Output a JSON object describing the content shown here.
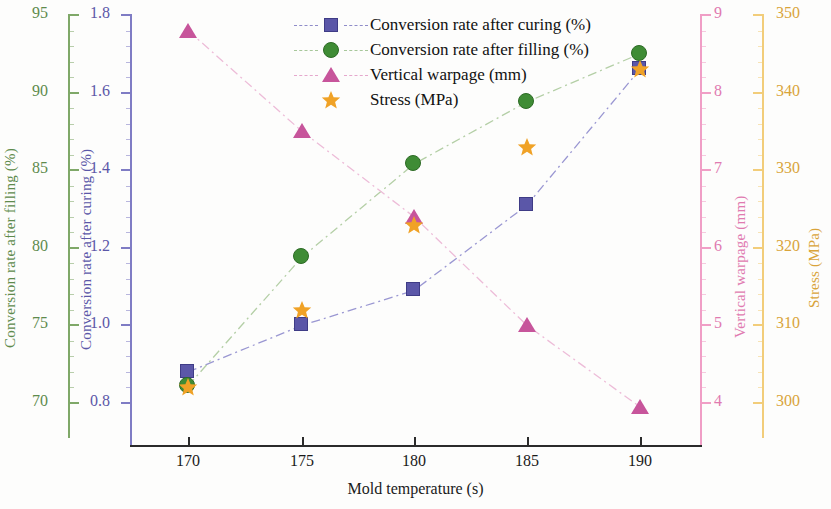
{
  "chart_data": {
    "type": "line",
    "title": "",
    "xlabel": "Mold temperature (s)",
    "x": [
      170,
      175,
      180,
      185,
      190
    ],
    "xticklabels": [
      "170",
      "175",
      "180",
      "185",
      "190"
    ],
    "grid": false,
    "legend_position": "top-center",
    "series": [
      {
        "name": "Conversion rate after curing (%)",
        "marker": "square",
        "color": "#5b57a8",
        "linestyle": "dash-dot",
        "axis": "left-inner",
        "values": [
          0.88,
          1.0,
          1.09,
          1.31,
          1.66
        ]
      },
      {
        "name": "Conversion rate after filling (%)",
        "marker": "circle",
        "color": "#3f8c35",
        "linestyle": "dash-dot",
        "axis": "left-outer",
        "values": [
          71.1,
          79.4,
          85.4,
          89.4,
          92.5
        ]
      },
      {
        "name": "Vertical warpage (mm)",
        "marker": "triangle",
        "color": "#c7559b",
        "linestyle": "dash-dot",
        "axis": "right-inner",
        "values": [
          8.8,
          7.5,
          6.4,
          5.0,
          3.95
        ]
      },
      {
        "name": "Stress (MPa)",
        "marker": "star",
        "color": "#f0a226",
        "linestyle": "none",
        "axis": "right-outer",
        "values": [
          302,
          312,
          323,
          333,
          343
        ]
      }
    ],
    "axes": [
      {
        "id": "left-outer",
        "label": "Conversion rate after filling (%)",
        "color": "#5e8b4c",
        "ticks": [
          95,
          90,
          85,
          80,
          75,
          70
        ],
        "ticklabels": [
          "95",
          "90",
          "85",
          "80",
          "75",
          "70"
        ],
        "lim": [
          68.1,
          95.96
        ]
      },
      {
        "id": "left-inner",
        "label": "Conversion rate after curing (%)",
        "color": "#5b57a8",
        "ticks": [
          1.8,
          1.6,
          1.4,
          1.2,
          1.0,
          0.8
        ],
        "ticklabels": [
          "1.8",
          "1.6",
          "1.4",
          "1.2",
          "1.0",
          "0.8"
        ],
        "lim": [
          0.724,
          1.838
        ]
      },
      {
        "id": "right-inner",
        "label": "Vertical warpage (mm)",
        "color": "#e07ab0",
        "ticks": [
          9,
          8,
          7,
          6,
          5,
          4
        ],
        "ticklabels": [
          "9",
          "8",
          "7",
          "6",
          "5",
          "4"
        ],
        "lim": [
          3.62,
          9.19
        ]
      },
      {
        "id": "right-outer",
        "label": "Stress (MPa)",
        "color": "#d9a43a",
        "ticks": [
          350,
          340,
          330,
          320,
          310,
          300
        ],
        "ticklabels": [
          "350",
          "340",
          "330",
          "320",
          "310",
          "300"
        ],
        "lim": [
          292.4,
          354.5
        ]
      }
    ]
  },
  "legend": {
    "items": [
      {
        "label": "Conversion rate after curing (%)"
      },
      {
        "label": "Conversion rate after filling (%)"
      },
      {
        "label": "Vertical warpage (mm)"
      },
      {
        "label": "Stress (MPa)"
      }
    ]
  }
}
